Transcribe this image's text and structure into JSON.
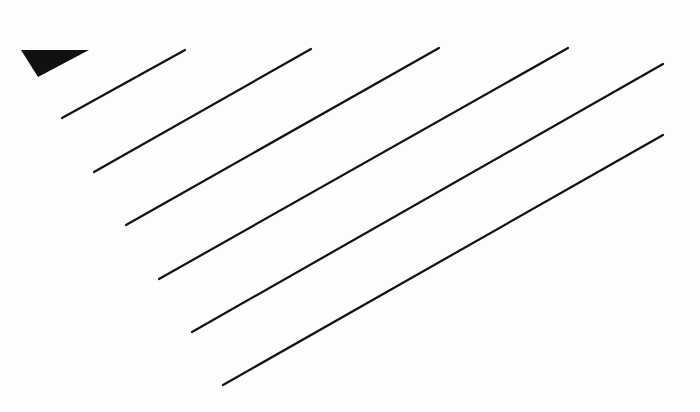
{
  "diagram": {
    "background": "#fdfdfd",
    "stroke_color": "#111111",
    "stroke_width": 2.2,
    "marker": {
      "shape": "triangle",
      "fill": "#111111",
      "points": [
        [
          21,
          50
        ],
        [
          89,
          50
        ],
        [
          38,
          77
        ]
      ]
    },
    "lines": [
      {
        "x1": 62,
        "y1": 118,
        "x2": 185,
        "y2": 50
      },
      {
        "x1": 94,
        "y1": 172,
        "x2": 311,
        "y2": 49
      },
      {
        "x1": 126,
        "y1": 225,
        "x2": 439,
        "y2": 48
      },
      {
        "x1": 159,
        "y1": 279,
        "x2": 568,
        "y2": 48
      },
      {
        "x1": 192,
        "y1": 332,
        "x2": 663,
        "y2": 64
      },
      {
        "x1": 223,
        "y1": 385,
        "x2": 663,
        "y2": 135
      }
    ]
  }
}
